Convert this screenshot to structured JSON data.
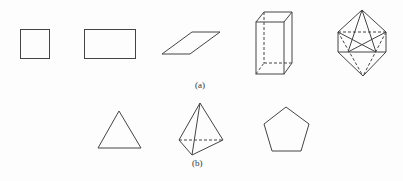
{
  "figure": {
    "stroke_color": "#444444",
    "part_a": {
      "label": "(a)",
      "shapes": [
        "square",
        "rectangle",
        "parallelogram",
        "rectangular-prism",
        "octahedron"
      ]
    },
    "part_b": {
      "label": "(b)",
      "shapes": [
        "triangle",
        "tetrahedron",
        "pentagon"
      ]
    }
  }
}
